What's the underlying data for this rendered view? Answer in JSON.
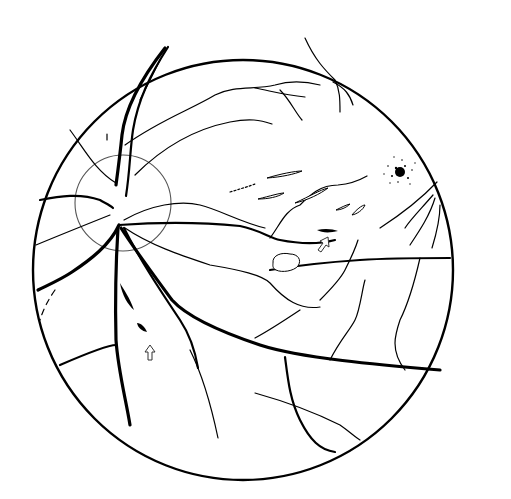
{
  "diagram": {
    "type": "fundus-illustration",
    "elements": {
      "fundus_boundary": "circle",
      "optic_disc": "circle-left",
      "macula": "stippled-spot",
      "hemorrhages": [
        "flame-hemorrhage-inferior",
        "flame-hemorrhage-temporal"
      ],
      "cotton_wool_spots": [
        "streak-1",
        "streak-2",
        "streak-3",
        "streak-4"
      ],
      "exudate": "outlined-blob",
      "arrows": [
        "arrow-inferior",
        "arrow-temporal"
      ]
    },
    "colors": {
      "stroke": "#000000",
      "background": "#ffffff",
      "disc_outline": "#555555"
    }
  }
}
